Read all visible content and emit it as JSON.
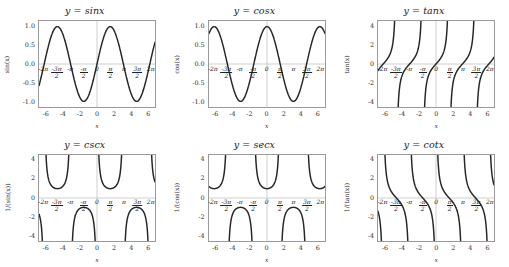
{
  "figure": {
    "background": "#ffffff",
    "grid_rows": 2,
    "grid_cols": 3,
    "curve_color": "#262626",
    "axis_color": "#9a9a9a",
    "xlabel": "x"
  },
  "chart_data": [
    {
      "type": "line",
      "title": "y = sinx",
      "xlabel": "x",
      "ylabel": "sin(x)",
      "xlim": [
        -6.9,
        6.9
      ],
      "ylim": [
        -1.15,
        1.15
      ],
      "grid": false,
      "legend": "none",
      "xticks": [
        -6,
        -4,
        -2,
        0,
        2,
        4,
        6
      ],
      "yticks": [
        "1.0",
        "0.5",
        "0.0",
        "-0.5",
        "-1.0"
      ],
      "ytick_values": [
        1.0,
        0.5,
        0.0,
        -0.5,
        -1.0
      ],
      "pi_ticks": [
        {
          "x": -6.283185,
          "label": "-2π",
          "type": "plain"
        },
        {
          "x": -4.712389,
          "label": "-3π/2",
          "type": "frac",
          "num": "-3π",
          "den": "2"
        },
        {
          "x": -3.141593,
          "label": "-π",
          "type": "plain"
        },
        {
          "x": -1.570796,
          "label": "-π/2",
          "type": "frac",
          "num": "-π",
          "den": "2"
        },
        {
          "x": 0,
          "label": "0",
          "type": "plain"
        },
        {
          "x": 1.570796,
          "label": "π/2",
          "type": "frac",
          "num": "π",
          "den": "2"
        },
        {
          "x": 3.141593,
          "label": "π",
          "type": "plain"
        },
        {
          "x": 4.712389,
          "label": "3π/2",
          "type": "frac",
          "num": "3π",
          "den": "2"
        },
        {
          "x": 6.283185,
          "label": "2π",
          "type": "plain"
        }
      ],
      "function": "sin",
      "description": "Sine curve, amplitude 1, period 2π, passing through origin."
    },
    {
      "type": "line",
      "title": "y = cosx",
      "xlabel": "x",
      "ylabel": "cos(x)",
      "xlim": [
        -6.9,
        6.9
      ],
      "ylim": [
        -1.15,
        1.15
      ],
      "grid": false,
      "legend": "none",
      "xticks": [
        -6,
        -4,
        -2,
        0,
        2,
        4,
        6
      ],
      "yticks": [
        "1.0",
        "0.5",
        "0.0",
        "-0.5",
        "-1.0"
      ],
      "ytick_values": [
        1.0,
        0.5,
        0.0,
        -0.5,
        -1.0
      ],
      "pi_ticks": [
        {
          "x": -6.283185,
          "label": "-2π",
          "type": "plain"
        },
        {
          "x": -4.712389,
          "label": "-3π/2",
          "type": "frac",
          "num": "-3π",
          "den": "2"
        },
        {
          "x": -3.141593,
          "label": "-π",
          "type": "plain"
        },
        {
          "x": -1.570796,
          "label": "-π/2",
          "type": "frac",
          "num": "-π",
          "den": "2"
        },
        {
          "x": 0,
          "label": "0",
          "type": "plain"
        },
        {
          "x": 1.570796,
          "label": "π/2",
          "type": "frac",
          "num": "π",
          "den": "2"
        },
        {
          "x": 3.141593,
          "label": "π",
          "type": "plain"
        },
        {
          "x": 4.712389,
          "label": "3π/2",
          "type": "frac",
          "num": "3π",
          "den": "2"
        },
        {
          "x": 6.283185,
          "label": "2π",
          "type": "plain"
        }
      ],
      "function": "cos",
      "description": "Cosine curve, amplitude 1, period 2π, maximum at x=0."
    },
    {
      "type": "line",
      "title": "y = tanx",
      "xlabel": "x",
      "ylabel": "tan(x)",
      "xlim": [
        -6.9,
        6.9
      ],
      "ylim": [
        -4.6,
        4.6
      ],
      "grid": false,
      "legend": "none",
      "xticks": [
        -6,
        -4,
        -2,
        0,
        2,
        4,
        6
      ],
      "yticks": [
        "4",
        "2",
        "0",
        "-2",
        "-4"
      ],
      "ytick_values": [
        4,
        2,
        0,
        -2,
        -4
      ],
      "pi_ticks": [
        {
          "x": -6.283185,
          "label": "-2π",
          "type": "plain"
        },
        {
          "x": -4.712389,
          "label": "-3π/2",
          "type": "frac",
          "num": "-3π",
          "den": "2"
        },
        {
          "x": -3.141593,
          "label": "-π",
          "type": "plain"
        },
        {
          "x": -1.570796,
          "label": "-π/2",
          "type": "frac",
          "num": "-π",
          "den": "2"
        },
        {
          "x": 0,
          "label": "0",
          "type": "plain"
        },
        {
          "x": 1.570796,
          "label": "π/2",
          "type": "frac",
          "num": "π",
          "den": "2"
        },
        {
          "x": 3.141593,
          "label": "π",
          "type": "plain"
        },
        {
          "x": 4.712389,
          "label": "3π/2",
          "type": "frac",
          "num": "3π",
          "den": "2"
        },
        {
          "x": 6.283185,
          "label": "2π",
          "type": "plain"
        }
      ],
      "function": "tan",
      "asymptotes": [
        -4.712389,
        -1.570796,
        1.570796,
        4.712389
      ],
      "description": "Tangent curve with vertical asymptotes at odd multiples of π/2."
    },
    {
      "type": "line",
      "title": "y = cscx",
      "xlabel": "x",
      "ylabel": "1/(sin(x))",
      "xlim": [
        -6.9,
        6.9
      ],
      "ylim": [
        -4.6,
        4.6
      ],
      "grid": false,
      "legend": "none",
      "xticks": [
        -6,
        -4,
        -2,
        0,
        2,
        4,
        6
      ],
      "yticks": [
        "4",
        "2",
        "0",
        "-2",
        "-4"
      ],
      "ytick_values": [
        4,
        2,
        0,
        -2,
        -4
      ],
      "pi_ticks": [
        {
          "x": -6.283185,
          "label": "-2π",
          "type": "plain"
        },
        {
          "x": -4.712389,
          "label": "-3π/2",
          "type": "frac",
          "num": "-3π",
          "den": "2"
        },
        {
          "x": -3.141593,
          "label": "-π",
          "type": "plain"
        },
        {
          "x": -1.570796,
          "label": "-π/2",
          "type": "frac",
          "num": "-π",
          "den": "2"
        },
        {
          "x": 0,
          "label": "0",
          "type": "plain"
        },
        {
          "x": 1.570796,
          "label": "π/2",
          "type": "frac",
          "num": "π",
          "den": "2"
        },
        {
          "x": 3.141593,
          "label": "π",
          "type": "plain"
        },
        {
          "x": 4.712389,
          "label": "3π/2",
          "type": "frac",
          "num": "3π",
          "den": "2"
        },
        {
          "x": 6.283185,
          "label": "2π",
          "type": "plain"
        }
      ],
      "function": "csc",
      "asymptotes": [
        -6.283185,
        -3.141593,
        0,
        3.141593,
        6.283185
      ],
      "description": "Cosecant curve, reciprocal of sine, asymptotes at multiples of π."
    },
    {
      "type": "line",
      "title": "y = secx",
      "xlabel": "x",
      "ylabel": "1/(cos(x))",
      "xlim": [
        -6.9,
        6.9
      ],
      "ylim": [
        -4.6,
        4.6
      ],
      "grid": false,
      "legend": "none",
      "xticks": [
        -6,
        -4,
        -2,
        0,
        2,
        4,
        6
      ],
      "yticks": [
        "4",
        "2",
        "0",
        "-2",
        "-4"
      ],
      "ytick_values": [
        4,
        2,
        0,
        -2,
        -4
      ],
      "pi_ticks": [
        {
          "x": -6.283185,
          "label": "-2π",
          "type": "plain"
        },
        {
          "x": -4.712389,
          "label": "-3π/2",
          "type": "frac",
          "num": "-3π",
          "den": "2"
        },
        {
          "x": -3.141593,
          "label": "-π",
          "type": "plain"
        },
        {
          "x": -1.570796,
          "label": "-π/2",
          "type": "frac",
          "num": "-π",
          "den": "2"
        },
        {
          "x": 0,
          "label": "0",
          "type": "plain"
        },
        {
          "x": 1.570796,
          "label": "π/2",
          "type": "frac",
          "num": "π",
          "den": "2"
        },
        {
          "x": 3.141593,
          "label": "π",
          "type": "plain"
        },
        {
          "x": 4.712389,
          "label": "3π/2",
          "type": "frac",
          "num": "3π",
          "den": "2"
        },
        {
          "x": 6.283185,
          "label": "2π",
          "type": "plain"
        }
      ],
      "function": "sec",
      "asymptotes": [
        -4.712389,
        -1.570796,
        1.570796,
        4.712389
      ],
      "description": "Secant curve, reciprocal of cosine, asymptotes at odd multiples of π/2."
    },
    {
      "type": "line",
      "title": "y = cotx",
      "xlabel": "x",
      "ylabel": "1/(tan(x))",
      "xlim": [
        -6.9,
        6.9
      ],
      "ylim": [
        -4.6,
        4.6
      ],
      "grid": false,
      "legend": "none",
      "xticks": [
        -6,
        -4,
        -2,
        0,
        2,
        4,
        6
      ],
      "yticks": [
        "4",
        "2",
        "0",
        "-2",
        "-4"
      ],
      "ytick_values": [
        4,
        2,
        0,
        -2,
        -4
      ],
      "pi_ticks": [
        {
          "x": -6.283185,
          "label": "-2π",
          "type": "plain"
        },
        {
          "x": -4.712389,
          "label": "-3π/2",
          "type": "frac",
          "num": "-3π",
          "den": "2"
        },
        {
          "x": -3.141593,
          "label": "-π",
          "type": "plain"
        },
        {
          "x": -1.570796,
          "label": "-π/2",
          "type": "frac",
          "num": "-π",
          "den": "2"
        },
        {
          "x": 0,
          "label": "0",
          "type": "plain"
        },
        {
          "x": 1.570796,
          "label": "π/2",
          "type": "frac",
          "num": "π",
          "den": "2"
        },
        {
          "x": 3.141593,
          "label": "π",
          "type": "plain"
        },
        {
          "x": 4.712389,
          "label": "3π/2",
          "type": "frac",
          "num": "3π",
          "den": "2"
        },
        {
          "x": 6.283185,
          "label": "2π",
          "type": "plain"
        }
      ],
      "function": "cot",
      "asymptotes": [
        -6.283185,
        -3.141593,
        0,
        3.141593,
        6.283185
      ],
      "description": "Cotangent curve, reciprocal of tangent, asymptotes at multiples of π."
    }
  ]
}
